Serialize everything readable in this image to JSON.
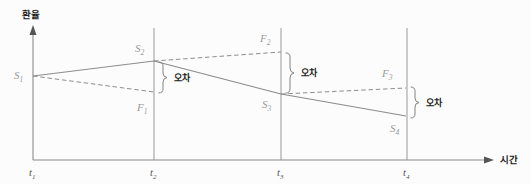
{
  "figure": {
    "type": "line-diagram",
    "background_color": "#fcfcfc",
    "axes": {
      "y_axis_title": "환율",
      "x_axis_title": "시간",
      "axis_color": "#8a8a8a",
      "y_axis_x": 33,
      "y_axis_top": 30,
      "x_axis_y": 160,
      "x_axis_right": 490
    },
    "time_ticks": [
      {
        "id": "t1",
        "base": "t",
        "sub": "1",
        "x": 33,
        "gridline": false
      },
      {
        "id": "t2",
        "base": "t",
        "sub": "2",
        "x": 154,
        "gridline": true
      },
      {
        "id": "t3",
        "base": "t",
        "sub": "3",
        "x": 281,
        "gridline": true
      },
      {
        "id": "t4",
        "base": "t",
        "sub": "4",
        "x": 407,
        "gridline": true
      }
    ],
    "gridline_top": 28,
    "spot_series": {
      "name": "현물환율",
      "style": "solid",
      "color": "#8c8c8c",
      "points": [
        {
          "label_base": "S",
          "label_sub": "1",
          "x": 33,
          "y": 76,
          "label_x": 18,
          "label_y": 78
        },
        {
          "label_base": "S",
          "label_sub": "2",
          "x": 154,
          "y": 61,
          "label_x": 137,
          "label_y": 51
        },
        {
          "label_base": "S",
          "label_sub": "3",
          "x": 281,
          "y": 94,
          "label_x": 263,
          "label_y": 107
        },
        {
          "label_base": "S",
          "label_sub": "4",
          "x": 406,
          "y": 116,
          "label_x": 392,
          "label_y": 131
        }
      ]
    },
    "forward_series": {
      "name": "선물환율",
      "style": "dashed",
      "color": "#8c8c8c",
      "segments": [
        {
          "label_base": "F",
          "label_sub": "1",
          "from_x": 33,
          "from_y": 76,
          "to_x": 154,
          "to_y": 92,
          "label_x": 139,
          "label_y": 110
        },
        {
          "label_base": "F",
          "label_sub": "2",
          "from_x": 154,
          "from_y": 61,
          "to_x": 281,
          "to_y": 52,
          "label_x": 262,
          "label_y": 41
        },
        {
          "label_base": "F",
          "label_sub": "3",
          "from_x": 281,
          "from_y": 94,
          "to_x": 406,
          "to_y": 88,
          "label_x": 384,
          "label_y": 76
        }
      ]
    },
    "error_braces": [
      {
        "id": "brace-t2",
        "label": "오차",
        "x": 163,
        "top_y": 62,
        "bottom_y": 93,
        "label_x": 178,
        "label_y": 81
      },
      {
        "id": "brace-t3",
        "label": "오차",
        "x": 290,
        "top_y": 53,
        "bottom_y": 93,
        "label_x": 305,
        "label_y": 76
      },
      {
        "id": "brace-t4",
        "label": "오차",
        "x": 415,
        "top_y": 87,
        "bottom_y": 117,
        "label_x": 430,
        "label_y": 106
      }
    ]
  }
}
